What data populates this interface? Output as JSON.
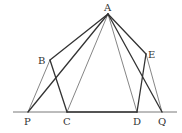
{
  "diagram": {
    "points": {
      "A": {
        "label": "A",
        "x": 108,
        "y": 14
      },
      "B": {
        "label": "B",
        "x": 50,
        "y": 60
      },
      "E": {
        "label": "E",
        "x": 146,
        "y": 54
      },
      "P": {
        "label": "P",
        "x": 28,
        "y": 112
      },
      "C": {
        "label": "C",
        "x": 67,
        "y": 112
      },
      "D": {
        "label": "D",
        "x": 137,
        "y": 112
      },
      "Q": {
        "label": "Q",
        "x": 162,
        "y": 112
      }
    },
    "baseline": {
      "x1": 13,
      "x2": 177,
      "y": 112
    },
    "segments": [
      {
        "from": "A",
        "to": "B",
        "weight": "thick"
      },
      {
        "from": "A",
        "to": "P",
        "weight": "thick"
      },
      {
        "from": "A",
        "to": "C",
        "weight": "thin"
      },
      {
        "from": "A",
        "to": "D",
        "weight": "thin"
      },
      {
        "from": "A",
        "to": "Q",
        "weight": "thick"
      },
      {
        "from": "A",
        "to": "E",
        "weight": "thick"
      },
      {
        "from": "B",
        "to": "P",
        "weight": "thin"
      },
      {
        "from": "B",
        "to": "C",
        "weight": "thick"
      },
      {
        "from": "E",
        "to": "D",
        "weight": "thick"
      },
      {
        "from": "E",
        "to": "Q",
        "weight": "thin"
      },
      {
        "from": "C",
        "to": "D",
        "weight": "thick"
      }
    ],
    "colors": {
      "line": "#333333",
      "background": "#ffffff"
    }
  }
}
